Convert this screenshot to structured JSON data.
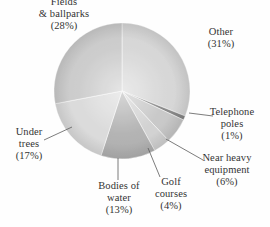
{
  "chart_data": {
    "type": "pie",
    "title": "",
    "subtitle": "",
    "xlabel": "",
    "ylabel": "",
    "legend_position": "none",
    "grid": false,
    "labels_outside": true,
    "start_angle_deg": 0,
    "direction": "clockwise",
    "categories": [
      "Other",
      "Telephone poles",
      "Near heavy equipment",
      "Golf courses",
      "Bodies of water",
      "Under trees",
      "Fields & ballparks"
    ],
    "values": [
      31,
      1,
      6,
      4,
      13,
      17,
      28
    ],
    "units": "percent",
    "total": 100,
    "slices": [
      {
        "name": "Other",
        "value": 31,
        "value_text": "(31%)",
        "color": "#cfcfcf"
      },
      {
        "name": "Telephone poles",
        "value": 1,
        "value_text": "(1%)",
        "color": "#6f6f6f"
      },
      {
        "name": "Near heavy equipment",
        "value": 6,
        "value_text": "(6%)",
        "color": "#bdbdbd"
      },
      {
        "name": "Golf courses",
        "value": 4,
        "value_text": "(4%)",
        "color": "#c9c9c9"
      },
      {
        "name": "Bodies of water",
        "value": 13,
        "value_text": "(13%)",
        "color": "#a2a2a2"
      },
      {
        "name": "Under trees",
        "value": 17,
        "value_text": "(17%)",
        "color": "#d4d4d4"
      },
      {
        "name": "Fields & ballparks",
        "value": 28,
        "value_text": "(28%)",
        "color": "#c2c2c2"
      }
    ]
  },
  "labels": {
    "fields": {
      "line1": "Fields",
      "line2": "& ballparks",
      "pct": "(28%)"
    },
    "other": {
      "line1": "Other",
      "pct": "(31%)"
    },
    "telephone": {
      "line1": "Telephone",
      "line2": "poles",
      "pct": "(1%)"
    },
    "heavy": {
      "line1": "Near heavy",
      "line2": "equipment",
      "pct": "(6%)"
    },
    "golf": {
      "line1": "Golf",
      "line2": "courses",
      "pct": "(4%)"
    },
    "water": {
      "line1": "Bodies of",
      "line2": "water",
      "pct": "(13%)"
    },
    "trees": {
      "line1": "Under",
      "line2": "trees",
      "pct": "(17%)"
    }
  },
  "style": {
    "background": "#ffffff",
    "text_color": "#171717",
    "leader_line_color": "#4a4a4a",
    "pie_center_x": 122,
    "pie_center_y": 91,
    "pie_radius": 68
  }
}
